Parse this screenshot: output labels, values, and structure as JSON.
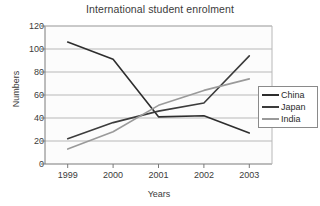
{
  "chart_data": {
    "type": "line",
    "title": "International student enrolment",
    "xlabel": "Years",
    "ylabel": "Numbers",
    "categories": [
      "1999",
      "2000",
      "2001",
      "2002",
      "2003"
    ],
    "x_tick_labels": [
      "1999",
      "2000",
      "2001",
      "2002",
      "2003"
    ],
    "y_tick_labels": [
      "0",
      "20",
      "40",
      "60",
      "80",
      "100",
      "120"
    ],
    "y_ticks": [
      0,
      20,
      40,
      60,
      80,
      100,
      120
    ],
    "ylim": [
      0,
      120
    ],
    "grid": "horizontal",
    "legend_position": "right",
    "series": [
      {
        "name": "China",
        "color": "#2e2e2e",
        "values": [
          106,
          91,
          41,
          42,
          27
        ]
      },
      {
        "name": "Japan",
        "color": "#3c3c3c",
        "values": [
          22,
          36,
          46,
          53,
          94
        ]
      },
      {
        "name": "India",
        "color": "#9a9a9a",
        "values": [
          13,
          28,
          51,
          64,
          74
        ]
      }
    ]
  },
  "legend": {
    "items": [
      {
        "label": "China"
      },
      {
        "label": "Japan"
      },
      {
        "label": "India"
      }
    ]
  },
  "colors": {
    "background": "#ffffff",
    "plot_background": "#fcfcfc",
    "grid": "#b8b8b8",
    "axis": "#7a7a7a",
    "text": "#3b3b3b",
    "legend_border": "#8a8a8a"
  }
}
